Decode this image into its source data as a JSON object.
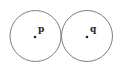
{
  "diagram": {
    "type": "tangent-circles",
    "stroke_color": "#808080",
    "point_color": "#222222",
    "circles": [
      {
        "id": "p",
        "label": "p",
        "cx": 35.5,
        "cy": 36,
        "r": 25.5
      },
      {
        "id": "q",
        "label": "q",
        "cx": 87,
        "cy": 36,
        "r": 25.5
      }
    ]
  }
}
